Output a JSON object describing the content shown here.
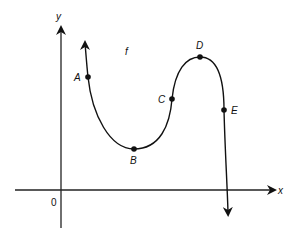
{
  "diagram": {
    "type": "function-graph",
    "function_label": "f",
    "axes": {
      "x_label": "x",
      "y_label": "y",
      "origin_label": "0"
    },
    "points": [
      {
        "name": "A",
        "description": "on descending left branch"
      },
      {
        "name": "B",
        "description": "local minimum"
      },
      {
        "name": "C",
        "description": "inflection point on rising section"
      },
      {
        "name": "D",
        "description": "local maximum"
      },
      {
        "name": "E",
        "description": "on descending right branch"
      }
    ],
    "colors": {
      "stroke": "#111111",
      "background": "#ffffff"
    }
  }
}
